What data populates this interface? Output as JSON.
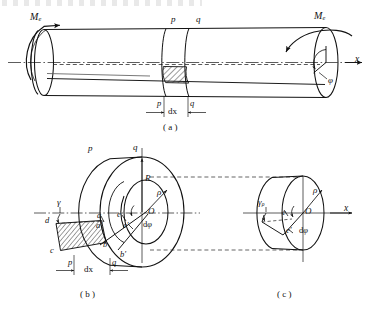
{
  "figure": {
    "panels": [
      {
        "id": "a",
        "caption": "( a )"
      },
      {
        "id": "b",
        "caption": "( b )"
      },
      {
        "id": "c",
        "caption": "( c )"
      }
    ]
  },
  "panel_a": {
    "moment_left": "M",
    "moment_left_sub": "e",
    "moment_right": "M",
    "moment_right_sub": "e",
    "section_p": "p",
    "section_q": "q",
    "section_p_bottom": "p",
    "section_q_bottom": "q",
    "length_label": "dx",
    "axis_label": "x",
    "angle_label": "φ"
  },
  "panel_b": {
    "section_p": "p",
    "section_q": "q",
    "radius_outer": "R",
    "radius_rho": "ρ",
    "center": "O",
    "angle_increment": "dφ",
    "shear_angle": "γ",
    "pt_a": "a",
    "pt_a_prime": "a′",
    "pt_b": "b",
    "pt_b_prime": "b′",
    "pt_c": "c",
    "pt_d": "d",
    "pt_e": "e",
    "pt_e_prime": "e′",
    "length_label": "dx",
    "length_p": "p",
    "length_q": "q"
  },
  "panel_c": {
    "radius_rho": "ρ",
    "center": "O",
    "angle_increment": "dφ",
    "shear_angle": "γ",
    "shear_angle_sub": "ρ",
    "pt_e": "e",
    "pt_e_prime": "e′",
    "axis_label": "x"
  },
  "colors": {
    "stroke": "#111111",
    "hatch": "#222222",
    "centerline": "#333333",
    "dashed": "#222222"
  }
}
